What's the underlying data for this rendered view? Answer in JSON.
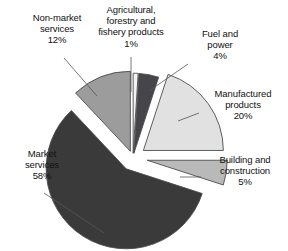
{
  "chart_data": {
    "type": "pie",
    "title": "",
    "subtitle": "",
    "xlabel": "",
    "ylabel": "",
    "grid": false,
    "legend_position": "none",
    "label_format": "name + percent",
    "exploded": true,
    "start_angle_deg": 0,
    "direction": "clockwise",
    "categories": [
      "Agricultural, forestry and fishery products",
      "Fuel and power",
      "Manufactured products",
      "Building and construction",
      "Market services",
      "Non-market services"
    ],
    "values": [
      1,
      4,
      20,
      5,
      58,
      12
    ],
    "units": "percent",
    "total": 100,
    "slices": [
      {
        "name": "Agricultural, forestry and fishery products",
        "value": 1,
        "percent_text": "1%",
        "color": "#f2f2f2",
        "start_deg": 0,
        "end_deg": 3.6,
        "explode": 0.06
      },
      {
        "name": "Fuel and power",
        "value": 4,
        "percent_text": "4%",
        "color": "#46464a",
        "start_deg": 3.6,
        "end_deg": 18.0,
        "explode": 0.06
      },
      {
        "name": "Manufactured products",
        "value": 20,
        "percent_text": "20%",
        "color": "#e1e1e1",
        "start_deg": 18.0,
        "end_deg": 90.0,
        "explode": 0.16
      },
      {
        "name": "Building and construction",
        "value": 5,
        "percent_text": "5%",
        "color": "#b9b9b9",
        "start_deg": 90.0,
        "end_deg": 108.0,
        "explode": 0.18
      },
      {
        "name": "Market services",
        "value": 58,
        "percent_text": "58%",
        "color": "#3a3a3a",
        "start_deg": 108.0,
        "end_deg": 316.8,
        "explode": 0.16
      },
      {
        "name": "Non-market services",
        "value": 12,
        "percent_text": "12%",
        "color": "#9c9c9c",
        "start_deg": 316.8,
        "end_deg": 360.0,
        "explode": 0.09
      }
    ],
    "labels": [
      {
        "key": "nonmarket",
        "text": "Non-market\nservices\n12%",
        "name_text": "Non-market services",
        "percent_text": "12%"
      },
      {
        "key": "agricultural",
        "text": "Agricultural,\nforestry and\nfishery products\n1%",
        "name_text": "Agricultural, forestry and fishery products",
        "percent_text": "1%"
      },
      {
        "key": "fuel",
        "text": "Fuel and\npower\n4%",
        "name_text": "Fuel and power",
        "percent_text": "4%"
      },
      {
        "key": "manufactured",
        "text": "Manufactured\nproducts\n20%",
        "name_text": "Manufactured products",
        "percent_text": "20%"
      },
      {
        "key": "building",
        "text": "Building and\nconstruction\n5%",
        "name_text": "Building and construction",
        "percent_text": "5%"
      },
      {
        "key": "market",
        "text": "Market\nservices\n58%",
        "name_text": "Market services",
        "percent_text": "58%"
      }
    ],
    "colors": {
      "background": "#ffffff",
      "outline": "#4d4d4d",
      "leader_line": "#555555",
      "text": "#111111"
    }
  },
  "geometry": {
    "center_x": 133,
    "center_y": 158,
    "radius": 80
  }
}
